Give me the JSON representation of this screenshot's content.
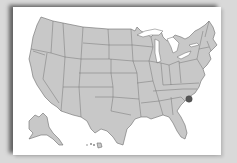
{
  "map": {
    "title": "United States map",
    "region": "USA",
    "insets": [
      "Alaska",
      "Hawaii"
    ],
    "fill_color": "#c8c8c8",
    "border_color": "#6b6b6b",
    "background_color": "#ffffff",
    "page_background": "#d9d9d9",
    "marker": {
      "state": "South Carolina",
      "color": "#555555",
      "icon": "location-dot-icon"
    }
  }
}
